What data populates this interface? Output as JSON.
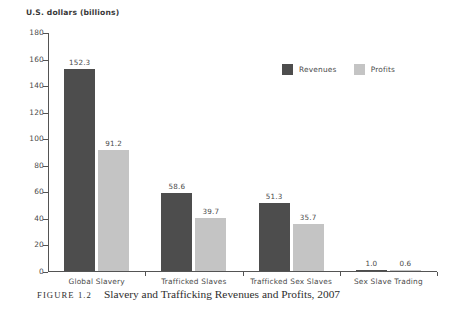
{
  "chart_data": {
    "type": "bar",
    "title": "",
    "ylabel": "U.S. dollars (billions)",
    "xlabel": "",
    "ylim": [
      0,
      180
    ],
    "yticks": [
      0,
      20,
      40,
      60,
      80,
      100,
      120,
      140,
      160,
      180
    ],
    "ytick_labels": [
      "0",
      "20",
      "40",
      "60",
      "80",
      "100",
      "120",
      "140",
      "160",
      "180"
    ],
    "grid": false,
    "legend_position": "top-center-right",
    "categories": [
      "Global Slavery",
      "Trafficked Slaves",
      "Trafficked Sex Slaves",
      "Sex Slave Trading"
    ],
    "series": [
      {
        "name": "Revenues",
        "color": "#4d4d4d",
        "values": [
          152.3,
          58.6,
          51.3,
          1.0
        ],
        "value_labels": [
          "152.3",
          "58.6",
          "51.3",
          "1.0"
        ]
      },
      {
        "name": "Profits",
        "color": "#c4c4c4",
        "values": [
          91.2,
          39.7,
          35.7,
          0.6
        ],
        "value_labels": [
          "91.2",
          "39.7",
          "35.7",
          "0.6"
        ]
      }
    ]
  },
  "caption": {
    "figure_number": "FIGURE 1.2",
    "text": "Slavery and Trafficking Revenues and Profits, 2007"
  }
}
